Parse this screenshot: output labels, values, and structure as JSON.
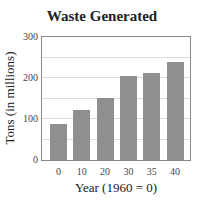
{
  "chart_data": {
    "type": "bar",
    "title": "Waste Generated",
    "xlabel": "Year (1960 = 0)",
    "ylabel": "Tons (in millions)",
    "categories": [
      "0",
      "10",
      "20",
      "30",
      "35",
      "40"
    ],
    "values": [
      88,
      121,
      152,
      205,
      212,
      238
    ],
    "ylim": [
      0,
      300
    ],
    "yticks": [
      "0",
      "100",
      "200",
      "300"
    ],
    "grid": true,
    "grid_interval": 50,
    "legend": null,
    "bar_color": "#8f8f8f"
  }
}
